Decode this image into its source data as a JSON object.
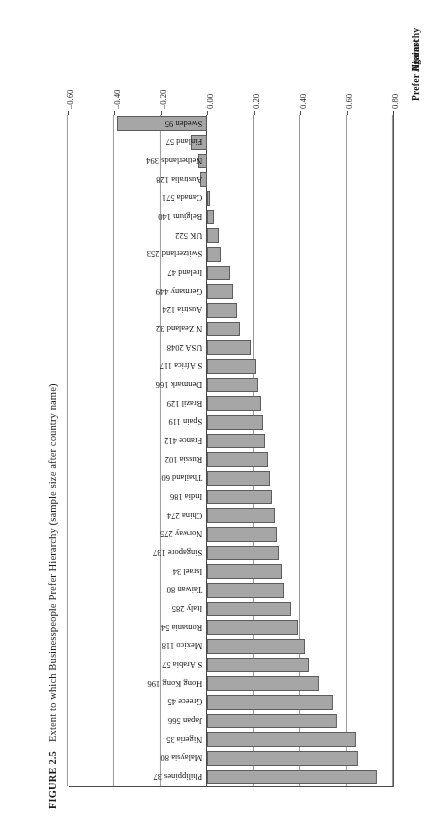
{
  "figure": {
    "number": "FIGURE 2.5",
    "caption": "Extent to which Businesspeople Prefer Hierarchy (sample size after country name)"
  },
  "axis": {
    "prefer_label": "Prefer Hierarchy",
    "against_label": "Against",
    "ticks": [
      "0.80",
      "0.60",
      "0.40",
      "0.20",
      "0.00",
      "–0.20",
      "–0.40",
      "–0.60"
    ],
    "tick_values": [
      0.8,
      0.6,
      0.4,
      0.2,
      0.0,
      -0.2,
      -0.4,
      -0.6
    ],
    "min": -0.6,
    "max": 0.8
  },
  "style": {
    "bar_fill": "#a6a6a6",
    "bar_stroke": "#5d5d5d",
    "grid_color": "#9a9a9a",
    "axis_color": "#4a4a4a",
    "background": "#ffffff"
  },
  "chart_data": {
    "type": "bar",
    "orientation": "horizontal",
    "title": "Extent to which Businesspeople Prefer Hierarchy (sample size after country name)",
    "xlabel": "",
    "ylabel": "",
    "xlim": [
      -0.6,
      0.8
    ],
    "grid": true,
    "legend": null,
    "axis_group_labels": [
      "Prefer Hierarchy",
      "Against"
    ],
    "categories": [
      "Philippines 37",
      "Malaysia 80",
      "Nigeria 35",
      "Japan 566",
      "Greece 45",
      "Hong Kong 196",
      "S Arabia 57",
      "Mexico 118",
      "Romania 54",
      "Italy 285",
      "Taiwan 80",
      "Israel 34",
      "Singapore 137",
      "Norway 275",
      "China 274",
      "India 186",
      "Thailand 60",
      "Russia 102",
      "France 412",
      "Spain 119",
      "Brazil 129",
      "Denmark 166",
      "S Africa 117",
      "USA 2048",
      "N Zealand 32",
      "Austria 124",
      "Germany 449",
      "Ireland 47",
      "Switzerland 253",
      "UK 522",
      "Belgium 140",
      "Canada 571",
      "Australia 128",
      "Netherlands 394",
      "Finland 57",
      "Sweden 95"
    ],
    "values": [
      0.73,
      0.65,
      0.64,
      0.56,
      0.54,
      0.48,
      0.44,
      0.42,
      0.39,
      0.36,
      0.33,
      0.32,
      0.31,
      0.3,
      0.29,
      0.28,
      0.27,
      0.26,
      0.25,
      0.24,
      0.23,
      0.22,
      0.21,
      0.19,
      0.14,
      0.13,
      0.11,
      0.1,
      0.06,
      0.05,
      0.03,
      0.01,
      -0.03,
      -0.04,
      -0.07,
      -0.39
    ],
    "countries": [
      {
        "label": "Philippines 37",
        "country": "Philippines",
        "n": 37,
        "value": 0.73
      },
      {
        "label": "Malaysia 80",
        "country": "Malaysia",
        "n": 80,
        "value": 0.65
      },
      {
        "label": "Nigeria 35",
        "country": "Nigeria",
        "n": 35,
        "value": 0.64
      },
      {
        "label": "Japan 566",
        "country": "Japan",
        "n": 566,
        "value": 0.56
      },
      {
        "label": "Greece 45",
        "country": "Greece",
        "n": 45,
        "value": 0.54
      },
      {
        "label": "Hong Kong 196",
        "country": "Hong Kong",
        "n": 196,
        "value": 0.48
      },
      {
        "label": "S Arabia 57",
        "country": "S Arabia",
        "n": 57,
        "value": 0.44
      },
      {
        "label": "Mexico 118",
        "country": "Mexico",
        "n": 118,
        "value": 0.42
      },
      {
        "label": "Romania 54",
        "country": "Romania",
        "n": 54,
        "value": 0.39
      },
      {
        "label": "Italy 285",
        "country": "Italy",
        "n": 285,
        "value": 0.36
      },
      {
        "label": "Taiwan 80",
        "country": "Taiwan",
        "n": 80,
        "value": 0.33
      },
      {
        "label": "Israel 34",
        "country": "Israel",
        "n": 34,
        "value": 0.32
      },
      {
        "label": "Singapore 137",
        "country": "Singapore",
        "n": 137,
        "value": 0.31
      },
      {
        "label": "Norway 275",
        "country": "Norway",
        "n": 275,
        "value": 0.3
      },
      {
        "label": "China 274",
        "country": "China",
        "n": 274,
        "value": 0.29
      },
      {
        "label": "India 186",
        "country": "India",
        "n": 186,
        "value": 0.28
      },
      {
        "label": "Thailand 60",
        "country": "Thailand",
        "n": 60,
        "value": 0.27
      },
      {
        "label": "Russia 102",
        "country": "Russia",
        "n": 102,
        "value": 0.26
      },
      {
        "label": "France 412",
        "country": "France",
        "n": 412,
        "value": 0.25
      },
      {
        "label": "Spain 119",
        "country": "Spain",
        "n": 119,
        "value": 0.24
      },
      {
        "label": "Brazil 129",
        "country": "Brazil",
        "n": 129,
        "value": 0.23
      },
      {
        "label": "Denmark 166",
        "country": "Denmark",
        "n": 166,
        "value": 0.22
      },
      {
        "label": "S Africa 117",
        "country": "S Africa",
        "n": 117,
        "value": 0.21
      },
      {
        "label": "USA 2048",
        "country": "USA",
        "n": 2048,
        "value": 0.19
      },
      {
        "label": "N Zealand 32",
        "country": "N Zealand",
        "n": 32,
        "value": 0.14
      },
      {
        "label": "Austria 124",
        "country": "Austria",
        "n": 124,
        "value": 0.13
      },
      {
        "label": "Germany 449",
        "country": "Germany",
        "n": 449,
        "value": 0.11
      },
      {
        "label": "Ireland 47",
        "country": "Ireland",
        "n": 47,
        "value": 0.1
      },
      {
        "label": "Switzerland 253",
        "country": "Switzerland",
        "n": 253,
        "value": 0.06
      },
      {
        "label": "UK 522",
        "country": "UK",
        "n": 522,
        "value": 0.05
      },
      {
        "label": "Belgium 140",
        "country": "Belgium",
        "n": 140,
        "value": 0.03
      },
      {
        "label": "Canada 571",
        "country": "Canada",
        "n": 571,
        "value": 0.01
      },
      {
        "label": "Australia 128",
        "country": "Australia",
        "n": 128,
        "value": -0.03
      },
      {
        "label": "Netherlands 394",
        "country": "Netherlands",
        "n": 394,
        "value": -0.04
      },
      {
        "label": "Finland 57",
        "country": "Finland",
        "n": 57,
        "value": -0.07
      },
      {
        "label": "Sweden 95",
        "country": "Sweden",
        "n": 95,
        "value": -0.39
      }
    ]
  }
}
